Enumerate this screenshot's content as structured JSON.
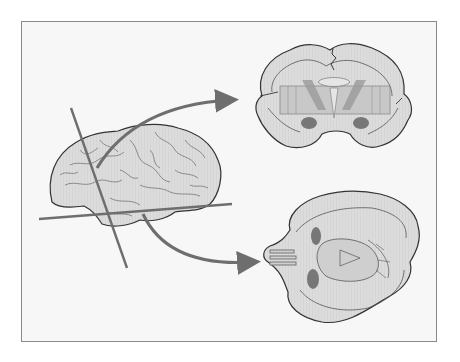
{
  "figure": {
    "panels": [
      {
        "name": "lateral-brain",
        "label": "Lateral view of brain with cutting planes"
      },
      {
        "name": "coronal-section",
        "label": "Coronal section"
      },
      {
        "name": "axial-section",
        "label": "Axial (horizontal) section"
      }
    ],
    "planes": [
      {
        "name": "coronal-plane",
        "orientation": "near-vertical"
      },
      {
        "name": "axial-plane",
        "orientation": "near-horizontal"
      }
    ],
    "arrows": [
      {
        "from": "coronal-plane",
        "to": "coronal-section"
      },
      {
        "from": "axial-plane",
        "to": "axial-section"
      }
    ],
    "colors": {
      "frame_border": "#8a8a8a",
      "frame_fill": "#f7f7f7",
      "brain_fill": "#d9d9d9",
      "outline": "#333333",
      "plane_line": "#6e6e6e",
      "arrow": "#6e6e6e",
      "white_matter": "#e6e6e6",
      "nucleus_dark": "#777777",
      "striatum": "#bdbdbd"
    }
  }
}
